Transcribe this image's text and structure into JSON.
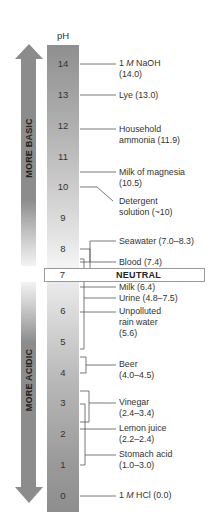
{
  "scale": {
    "header": "pH",
    "ticks": [
      "14",
      "13",
      "12",
      "11",
      "10",
      "9",
      "8",
      "7",
      "6",
      "5",
      "4",
      "3",
      "2",
      "1",
      "0"
    ],
    "neutral_value": "7",
    "neutral_label": "NEUTRAL"
  },
  "arrows": {
    "up_label": "MORE BASIC",
    "down_label": "MORE ACIDIC",
    "color": "#8c8c8c"
  },
  "substances": [
    {
      "name_prefix": "1 ",
      "name_italic": "M",
      "name": " NaOH",
      "value": "(14.0)",
      "ph": 14.0
    },
    {
      "name": "Lye (13.0)",
      "ph": 13.0
    },
    {
      "name": "Household",
      "value": "ammonia (11.9)",
      "ph": 11.9
    },
    {
      "name": "Milk of magnesia",
      "value": "(10.5)",
      "ph": 10.5
    },
    {
      "name": "Detergent",
      "value": "solution (~10)",
      "ph": 10.0
    },
    {
      "name": "Seawater (7.0–8.3)",
      "ph_range": [
        7.0,
        8.3
      ]
    },
    {
      "name": "Blood (7.4)",
      "ph": 7.4
    },
    {
      "name": "Milk (6.4)",
      "ph": 6.4
    },
    {
      "name": "Urine (4.8–7.5)",
      "ph_range": [
        4.8,
        7.5
      ]
    },
    {
      "name": "Unpolluted",
      "value_line2": "rain water",
      "value": "(5.6)",
      "ph": 5.6
    },
    {
      "name": "Beer",
      "value": "(4.0–4.5)",
      "ph_range": [
        4.0,
        4.5
      ]
    },
    {
      "name": "Vinegar",
      "value": "(2.4–3.4)",
      "ph_range": [
        2.4,
        3.4
      ]
    },
    {
      "name": "Lemon juice",
      "value": "(2.2–2.4)",
      "ph_range": [
        2.2,
        2.4
      ]
    },
    {
      "name": "Stomach acid",
      "value": "(1.0–3.0)",
      "ph_range": [
        1.0,
        3.0
      ]
    },
    {
      "name_prefix": "1 ",
      "name_italic": "M",
      "name": " HCl (0.0)",
      "ph": 0.0
    }
  ]
}
